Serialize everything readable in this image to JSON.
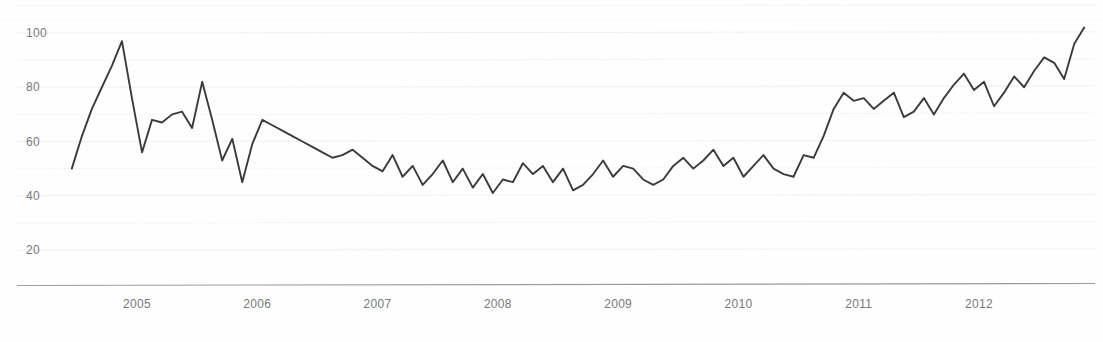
{
  "chart_data": {
    "type": "line",
    "title": "",
    "subtitle": "",
    "xlabel": "",
    "ylabel": "",
    "ylim": [
      10,
      110
    ],
    "xlim": [
      2004.45,
      2012.92
    ],
    "grid": true,
    "legend_position": "none",
    "line_color": "#3b3b3d",
    "y_ticks": [
      20,
      40,
      60,
      80,
      100
    ],
    "y_tick_labels": [
      "20",
      "40",
      "60",
      "80",
      "100"
    ],
    "x_ticks": [
      2005,
      2006,
      2007,
      2008,
      2009,
      2010,
      2011,
      2012
    ],
    "x_tick_labels": [
      "2005",
      "2006",
      "2007",
      "2008",
      "2009",
      "2010",
      "2011",
      "2012"
    ],
    "series": [
      {
        "name": "series-1",
        "color": "#3b3b3d",
        "x": [
          2004.458,
          2004.542,
          2004.625,
          2004.708,
          2004.792,
          2004.875,
          2004.958,
          2005.042,
          2005.125,
          2005.208,
          2005.292,
          2005.375,
          2005.458,
          2005.542,
          2005.625,
          2005.708,
          2005.792,
          2005.875,
          2005.958,
          2006.042,
          2006.125,
          2006.208,
          2006.292,
          2006.375,
          2006.458,
          2006.542,
          2006.625,
          2006.708,
          2006.792,
          2006.875,
          2006.958,
          2007.042,
          2007.125,
          2007.208,
          2007.292,
          2007.375,
          2007.458,
          2007.542,
          2007.625,
          2007.708,
          2007.792,
          2007.875,
          2007.958,
          2008.042,
          2008.125,
          2008.208,
          2008.292,
          2008.375,
          2008.458,
          2008.542,
          2008.625,
          2008.708,
          2008.792,
          2008.875,
          2008.958,
          2009.042,
          2009.125,
          2009.208,
          2009.292,
          2009.375,
          2009.458,
          2009.542,
          2009.625,
          2009.708,
          2009.792,
          2009.875,
          2009.958,
          2010.042,
          2010.125,
          2010.208,
          2010.292,
          2010.375,
          2010.458,
          2010.542,
          2010.625,
          2010.708,
          2010.792,
          2010.875,
          2010.958,
          2011.042,
          2011.125,
          2011.208,
          2011.292,
          2011.375,
          2011.458,
          2011.542,
          2011.625,
          2011.708,
          2011.792,
          2011.875,
          2011.958,
          2012.042,
          2012.125,
          2012.208,
          2012.292,
          2012.375,
          2012.458,
          2012.542,
          2012.625,
          2012.708,
          2012.792,
          2012.875
        ],
        "values": [
          50,
          62,
          72,
          80,
          88,
          97,
          76,
          56,
          68,
          67,
          70,
          71,
          65,
          82,
          68,
          53,
          61,
          45,
          59,
          68,
          66,
          64,
          62,
          60,
          58,
          56,
          54,
          55,
          57,
          54,
          51,
          49,
          55,
          47,
          51,
          44,
          48,
          53,
          45,
          50,
          43,
          48,
          41,
          46,
          45,
          52,
          48,
          51,
          45,
          50,
          42,
          44,
          48,
          53,
          47,
          51,
          50,
          46,
          44,
          46,
          51,
          54,
          50,
          53,
          57,
          51,
          54,
          47,
          51,
          55,
          50,
          48,
          47,
          55,
          54,
          62,
          72,
          78,
          75,
          76,
          72,
          75,
          78,
          69,
          71,
          76,
          70,
          76,
          81,
          85,
          79,
          82,
          73,
          78,
          84,
          80,
          86,
          91,
          89,
          83,
          96,
          102
        ]
      }
    ]
  },
  "axis": {
    "y_label_color": "#77797c",
    "x_label_color": "#77797c",
    "baseline_color": "#9a9c9f"
  }
}
